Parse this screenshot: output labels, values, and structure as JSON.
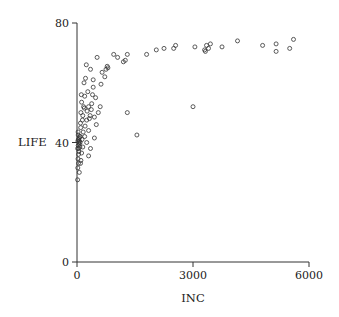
{
  "chart_data": {
    "type": "scatter",
    "title": "",
    "xlabel": "INC",
    "ylabel": "LIFE",
    "xlim": [
      0,
      6000
    ],
    "ylim": [
      0,
      80
    ],
    "xticks": [
      0,
      3000,
      6000
    ],
    "yticks": [
      0,
      40,
      80
    ],
    "xtick_labels": [
      "0",
      "3000",
      "6000"
    ],
    "ytick_labels": [
      "0",
      "40",
      "80"
    ],
    "grid": false,
    "legend": null,
    "marker": "open-circle",
    "colors": {
      "marker": "#333333",
      "axis": "#333333",
      "background": "#ffffff"
    },
    "series": [
      {
        "name": "LIFE vs INC",
        "points": [
          [
            5600,
            74.5
          ],
          [
            5500,
            71.5
          ],
          [
            5150,
            73
          ],
          [
            5150,
            70.5
          ],
          [
            4800,
            72.5
          ],
          [
            4150,
            74
          ],
          [
            3750,
            72
          ],
          [
            3450,
            73
          ],
          [
            3400,
            71.5
          ],
          [
            3350,
            72.5
          ],
          [
            3320,
            70.5
          ],
          [
            3300,
            71
          ],
          [
            3000,
            52
          ],
          [
            3050,
            72
          ],
          [
            2550,
            72.5
          ],
          [
            2500,
            71.5
          ],
          [
            2250,
            71.5
          ],
          [
            2050,
            71
          ],
          [
            1800,
            69.5
          ],
          [
            1550,
            42.5
          ],
          [
            1300,
            50
          ],
          [
            1300,
            69.5
          ],
          [
            1250,
            67.5
          ],
          [
            1200,
            67
          ],
          [
            1050,
            68.5
          ],
          [
            950,
            69.5
          ],
          [
            800,
            65
          ],
          [
            780,
            65.5
          ],
          [
            750,
            64.5
          ],
          [
            720,
            62
          ],
          [
            650,
            63.5
          ],
          [
            620,
            59.5
          ],
          [
            600,
            52
          ],
          [
            520,
            68.5
          ],
          [
            480,
            55
          ],
          [
            420,
            61
          ],
          [
            420,
            58.5
          ],
          [
            400,
            56
          ],
          [
            380,
            53
          ],
          [
            370,
            51
          ],
          [
            350,
            64.5
          ],
          [
            340,
            49
          ],
          [
            320,
            48
          ],
          [
            300,
            52
          ],
          [
            300,
            44
          ],
          [
            280,
            57
          ],
          [
            260,
            50.5
          ],
          [
            250,
            47.5
          ],
          [
            240,
            66
          ],
          [
            220,
            61.5
          ],
          [
            210,
            45.5
          ],
          [
            200,
            55.5
          ],
          [
            190,
            51.5
          ],
          [
            180,
            60
          ],
          [
            170,
            52
          ],
          [
            160,
            43.5
          ],
          [
            150,
            49
          ],
          [
            140,
            47.5
          ],
          [
            130,
            41
          ],
          [
            120,
            53.5
          ],
          [
            110,
            56
          ],
          [
            100,
            50
          ],
          [
            95,
            45
          ],
          [
            90,
            46.5
          ],
          [
            85,
            42
          ],
          [
            80,
            40
          ],
          [
            75,
            38.5
          ],
          [
            70,
            42
          ],
          [
            65,
            40.5
          ],
          [
            60,
            39.5
          ],
          [
            55,
            41.5
          ],
          [
            50,
            37
          ],
          [
            48,
            40
          ],
          [
            45,
            38
          ],
          [
            40,
            36
          ],
          [
            38,
            33
          ],
          [
            35,
            41
          ],
          [
            32,
            39
          ],
          [
            30,
            42.5
          ],
          [
            28,
            43.5
          ],
          [
            25,
            34.5
          ],
          [
            22,
            40.5
          ],
          [
            20,
            31.5
          ],
          [
            18,
            38
          ],
          [
            15,
            27.5
          ],
          [
            300,
            35.5
          ],
          [
            500,
            46
          ],
          [
            450,
            41.5
          ],
          [
            350,
            38
          ],
          [
            250,
            40
          ],
          [
            200,
            42
          ],
          [
            150,
            38.5
          ],
          [
            120,
            36.5
          ],
          [
            100,
            34
          ],
          [
            90,
            33
          ],
          [
            60,
            30
          ],
          [
            450,
            48.5
          ],
          [
            550,
            50
          ]
        ]
      }
    ],
    "plot_area_px": {
      "x0": 77,
      "x1": 309,
      "y0": 262,
      "y1": 23
    }
  }
}
